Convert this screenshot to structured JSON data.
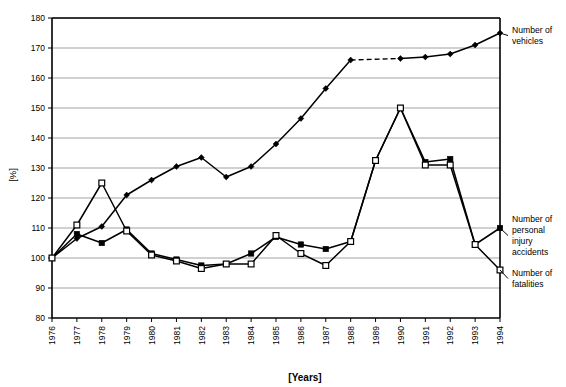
{
  "chart_data": {
    "type": "line",
    "title": "",
    "xlabel": "[Years]",
    "ylabel": "[%]",
    "xlim": [
      1976,
      1994
    ],
    "ylim": [
      80,
      180
    ],
    "ytick_step": 10,
    "yticks": [
      80,
      90,
      100,
      110,
      120,
      130,
      140,
      150,
      160,
      170,
      180
    ],
    "grid": "horizontal",
    "legend_position": "right-annotations",
    "categories": [
      1976,
      1977,
      1978,
      1979,
      1980,
      1981,
      1982,
      1983,
      1984,
      1985,
      1986,
      1987,
      1988,
      1989,
      1990,
      1991,
      1992,
      1993,
      1994
    ],
    "xticklabels": [
      "1976",
      "1977",
      "1978",
      "1979",
      "1980",
      "1981",
      "1982",
      "1983",
      "1984",
      "1985",
      "1986",
      "1987",
      "1988",
      "1989",
      "1990",
      "1991",
      "1992",
      "1993",
      "1994"
    ],
    "series": [
      {
        "name": "Number of vehicles",
        "marker": "filled-diamond",
        "line": "solid-with-dashed-gap",
        "dashed_segment": [
          1988,
          1990
        ],
        "x": [
          1976,
          1977,
          1978,
          1979,
          1980,
          1981,
          1982,
          1983,
          1984,
          1985,
          1986,
          1987,
          1988,
          1990,
          1991,
          1992,
          1993,
          1994
        ],
        "values": [
          100,
          106.5,
          110.5,
          121,
          126,
          130.5,
          133.5,
          127,
          130.5,
          138,
          146.5,
          156.5,
          166,
          166.5,
          167,
          168,
          171,
          175
        ]
      },
      {
        "name": "Number of personal injury accidents",
        "marker": "filled-square",
        "line": "solid",
        "x": [
          1976,
          1977,
          1978,
          1979,
          1980,
          1981,
          1982,
          1983,
          1984,
          1985,
          1986,
          1987,
          1988,
          1989,
          1990,
          1991,
          1992,
          1993,
          1994
        ],
        "values": [
          100,
          108,
          105,
          109.5,
          101.5,
          99.5,
          97.5,
          98,
          101.5,
          107,
          104.5,
          103,
          105.5,
          132.5,
          150,
          132,
          133,
          104.5,
          110
        ]
      },
      {
        "name": "Number of fatalities",
        "marker": "open-square",
        "line": "solid",
        "x": [
          1976,
          1977,
          1978,
          1979,
          1980,
          1981,
          1982,
          1983,
          1984,
          1985,
          1986,
          1987,
          1988,
          1989,
          1990,
          1991,
          1992,
          1993,
          1994
        ],
        "values": [
          100,
          111,
          125,
          109,
          101,
          99,
          96.5,
          98,
          98,
          107.5,
          101.5,
          97.5,
          105.5,
          132.5,
          150,
          131,
          131,
          104.5,
          96
        ]
      }
    ],
    "annotations": [
      {
        "id": "ann-vehicles",
        "text_lines": [
          "Number of",
          "vehicles"
        ],
        "target_year": 1994,
        "target_value": 175
      },
      {
        "id": "ann-accidents",
        "text_lines": [
          "Number of",
          "personal",
          "injury",
          "accidents"
        ],
        "target_year": 1994,
        "target_value": 110
      },
      {
        "id": "ann-fatalities",
        "text_lines": [
          "Number of",
          "fatalities"
        ],
        "target_year": 1994,
        "target_value": 96
      }
    ]
  },
  "axes": {
    "y_axis_title": "[%]",
    "x_axis_title": "[Years]"
  }
}
